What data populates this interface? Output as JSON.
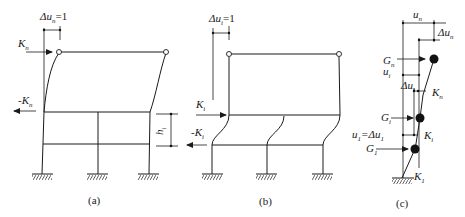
{
  "figure": {
    "panels": [
      {
        "id": "a",
        "caption": "(a)",
        "top_label": {
          "main": "Δu",
          "sub": "n",
          "rest": "=1"
        },
        "force_top": {
          "main": "K",
          "sub": "n"
        },
        "force_bottom": {
          "main": "-K",
          "sub": "n"
        },
        "height_label": {
          "main": "h",
          "sub": "i"
        }
      },
      {
        "id": "b",
        "caption": "(b)",
        "top_label": {
          "main": "Δu",
          "sub": "i",
          "rest": "=1"
        },
        "force_top": {
          "main": "K",
          "sub": "i"
        },
        "force_bottom": {
          "main": "-K",
          "sub": "i"
        }
      },
      {
        "id": "c",
        "caption": "(c)",
        "labels": {
          "un": {
            "main": "u",
            "sub": "n"
          },
          "dun": {
            "main": "Δu",
            "sub": "n"
          },
          "Gn": {
            "main": "G",
            "sub": "n"
          },
          "ui": {
            "main": "u",
            "sub": "i"
          },
          "dui": {
            "main": "Δu",
            "sub": "i"
          },
          "Kn": {
            "main": "K",
            "sub": "n"
          },
          "Gi": {
            "main": "G",
            "sub": "i"
          },
          "u1": {
            "main": "u",
            "sub": "1",
            "rest": "=Δu",
            "sub2": "1"
          },
          "Ki": {
            "main": "K",
            "sub": "i"
          },
          "G1": {
            "main": "G",
            "sub": "1"
          },
          "K1": {
            "main": "K",
            "sub": "1"
          }
        }
      }
    ]
  },
  "colors": {
    "ink": "#1a1a1a",
    "background": "#ffffff"
  }
}
